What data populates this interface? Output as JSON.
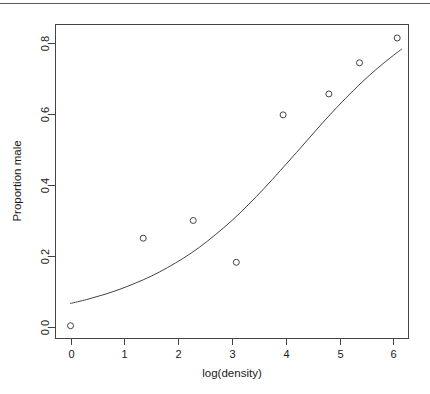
{
  "figure": {
    "background_color": "#ffffff",
    "foreground_color": "#444444",
    "top_rule_color": "#5a5a5a"
  },
  "chart_data": {
    "type": "scatter",
    "title": "",
    "subtitle": "",
    "xlabel": "log(density)",
    "ylabel": "Proportion male",
    "xlim": [
      -0.28,
      6.28
    ],
    "ylim": [
      -0.033,
      0.853
    ],
    "grid": false,
    "legend": null,
    "x_ticks": [
      0,
      1,
      2,
      3,
      4,
      5,
      6
    ],
    "x_tick_labels": [
      "0",
      "1",
      "2",
      "3",
      "4",
      "5",
      "6"
    ],
    "y_ticks": [
      0.0,
      0.2,
      0.4,
      0.6,
      0.8
    ],
    "y_tick_labels": [
      "0.0",
      "0.2",
      "0.4",
      "0.6",
      "0.8"
    ],
    "series": [
      {
        "name": "observed",
        "type": "scatter",
        "marker": "open-circle",
        "marker_size": 3,
        "color": "#444444",
        "points": [
          {
            "x": 0.0,
            "y": 0.003
          },
          {
            "x": 1.35,
            "y": 0.25
          },
          {
            "x": 2.28,
            "y": 0.3
          },
          {
            "x": 3.08,
            "y": 0.182
          },
          {
            "x": 3.95,
            "y": 0.598
          },
          {
            "x": 4.8,
            "y": 0.657
          },
          {
            "x": 5.37,
            "y": 0.745
          },
          {
            "x": 6.07,
            "y": 0.815
          }
        ]
      },
      {
        "name": "fitted-logistic-curve",
        "type": "line",
        "color": "#444444",
        "line_width": 1,
        "points": [
          {
            "x": 0.0,
            "y": 0.066
          },
          {
            "x": 0.3,
            "y": 0.077
          },
          {
            "x": 0.6,
            "y": 0.09
          },
          {
            "x": 0.9,
            "y": 0.105
          },
          {
            "x": 1.2,
            "y": 0.123
          },
          {
            "x": 1.5,
            "y": 0.143
          },
          {
            "x": 1.8,
            "y": 0.167
          },
          {
            "x": 2.1,
            "y": 0.194
          },
          {
            "x": 2.4,
            "y": 0.225
          },
          {
            "x": 2.7,
            "y": 0.261
          },
          {
            "x": 3.0,
            "y": 0.3
          },
          {
            "x": 3.3,
            "y": 0.344
          },
          {
            "x": 3.6,
            "y": 0.391
          },
          {
            "x": 3.9,
            "y": 0.441
          },
          {
            "x": 4.2,
            "y": 0.492
          },
          {
            "x": 4.5,
            "y": 0.544
          },
          {
            "x": 4.8,
            "y": 0.595
          },
          {
            "x": 5.1,
            "y": 0.643
          },
          {
            "x": 5.4,
            "y": 0.688
          },
          {
            "x": 5.7,
            "y": 0.729
          },
          {
            "x": 6.0,
            "y": 0.766
          },
          {
            "x": 6.15,
            "y": 0.783
          }
        ]
      }
    ]
  }
}
